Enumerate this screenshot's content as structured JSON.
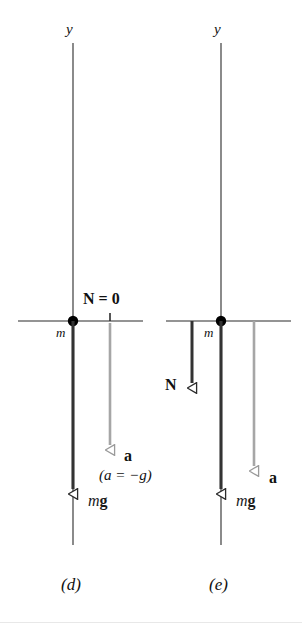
{
  "figure": {
    "type": "physics-free-body-diagram",
    "background_color": "#ffffff",
    "width": 302,
    "height": 636,
    "colors": {
      "axis_line": "#2b2b2b",
      "force_arrow_dark": "#333333",
      "acceleration_arrow_gray": "#a6a6a6",
      "mass_dot": "#000000",
      "text": "#111111"
    },
    "panels": [
      {
        "id": "d",
        "caption": "(d)",
        "axis_label": "y",
        "mass_label": "m",
        "normal_force_label": "N = 0",
        "weight_label": {
          "italic": "m",
          "bold": "g"
        },
        "acceleration_label": "a",
        "acceleration_note": "(a = −g)",
        "arrows": [
          {
            "name": "weight",
            "label": "mg",
            "color": "#333333",
            "direction": "down",
            "length_px": 179
          },
          {
            "name": "acceleration",
            "label": "a",
            "color": "#a6a6a6",
            "direction": "down",
            "length_px": 134
          }
        ]
      },
      {
        "id": "e",
        "caption": "(e)",
        "axis_label": "y",
        "mass_label": "m",
        "normal_force_label": "N",
        "weight_label": {
          "italic": "m",
          "bold": "g"
        },
        "acceleration_label": "a",
        "arrows": [
          {
            "name": "normal-force",
            "label": "N",
            "color": "#333333",
            "direction": "down",
            "length_px": 73
          },
          {
            "name": "weight",
            "label": "mg",
            "color": "#333333",
            "direction": "down",
            "length_px": 179
          },
          {
            "name": "acceleration",
            "label": "a",
            "color": "#a6a6a6",
            "direction": "down",
            "length_px": 155
          }
        ]
      }
    ]
  }
}
